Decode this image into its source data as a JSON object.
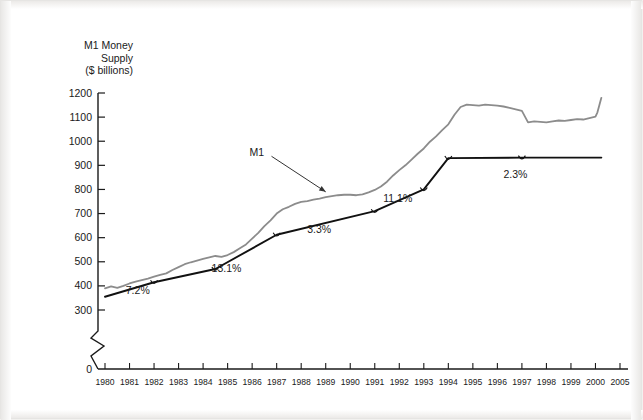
{
  "figure": {
    "title_lines": [
      "M1 Money",
      "Supply",
      "($ billions)"
    ],
    "background": "#ffffff",
    "frame_color": "#e6e5e3"
  },
  "chart_data": {
    "type": "line",
    "title": "M1 Money Supply ($ billions)",
    "xlabel": "",
    "ylabel": "M1 Money Supply ($ billions)",
    "ylim": [
      300,
      1200
    ],
    "y_axis_break_at": 0,
    "grid": false,
    "legend": "inline-annotation",
    "yticks": [
      0,
      300,
      400,
      500,
      600,
      700,
      800,
      900,
      1000,
      1100,
      1200
    ],
    "xticks": [
      "1980",
      "1981",
      "1982",
      "1983",
      "1984",
      "1985",
      "1986",
      "1987",
      "1988",
      "1989",
      "1990",
      "1991",
      "1992",
      "1993",
      "1994",
      "1995",
      "1996",
      "1997",
      "1998",
      "1999",
      "2000",
      "2005"
    ],
    "series": [
      {
        "name": "M1",
        "color": "#8c8c8c",
        "style": "actual monthly money supply",
        "x": [
          1980.0,
          1980.25,
          1980.5,
          1980.75,
          1981.0,
          1981.25,
          1981.5,
          1981.75,
          1982.0,
          1982.25,
          1982.5,
          1982.75,
          1983.0,
          1983.25,
          1983.5,
          1983.75,
          1984.0,
          1984.25,
          1984.5,
          1984.75,
          1985.0,
          1985.25,
          1985.5,
          1985.75,
          1986.0,
          1986.25,
          1986.5,
          1986.75,
          1987.0,
          1987.25,
          1987.5,
          1987.75,
          1988.0,
          1988.25,
          1988.5,
          1988.75,
          1989.0,
          1989.25,
          1989.5,
          1989.75,
          1990.0,
          1990.25,
          1990.5,
          1990.75,
          1991.0,
          1991.25,
          1991.5,
          1991.75,
          1992.0,
          1992.25,
          1992.5,
          1992.75,
          1993.0,
          1993.25,
          1993.5,
          1993.75,
          1994.0,
          1994.25,
          1994.5,
          1994.75,
          1995.0,
          1995.25,
          1995.5,
          1995.75,
          1996.0,
          1996.25,
          1996.5,
          1996.75,
          1997.0,
          1997.25,
          1997.5,
          1997.75,
          1998.0,
          1998.25,
          1998.5,
          1998.75,
          1999.0,
          1999.25,
          1999.5,
          1999.75,
          2000.0,
          2000.4,
          2000.8,
          2001.2
        ],
        "y": [
          390,
          398,
          392,
          400,
          410,
          418,
          424,
          430,
          438,
          446,
          452,
          466,
          478,
          490,
          498,
          505,
          512,
          518,
          524,
          520,
          528,
          540,
          556,
          572,
          596,
          620,
          648,
          672,
          700,
          718,
          728,
          740,
          748,
          752,
          758,
          762,
          768,
          772,
          776,
          778,
          778,
          776,
          780,
          788,
          798,
          812,
          832,
          858,
          880,
          900,
          924,
          948,
          970,
          998,
          1020,
          1046,
          1070,
          1110,
          1142,
          1152,
          1150,
          1148,
          1152,
          1150,
          1148,
          1144,
          1138,
          1132,
          1126,
          1078,
          1082,
          1080,
          1078,
          1082,
          1086,
          1084,
          1088,
          1092,
          1090,
          1096,
          1102,
          1120,
          1150,
          1180
        ]
      },
      {
        "name": "Trend (growth-rate segments)",
        "color": "#111111",
        "style": "piecewise linear trend",
        "breakpoints": [
          {
            "x": 1980.0,
            "y": 355
          },
          {
            "x": 1982.0,
            "y": 415
          },
          {
            "x": 1984.5,
            "y": 470
          },
          {
            "x": 1987.0,
            "y": 612
          },
          {
            "x": 1991.0,
            "y": 710
          },
          {
            "x": 1993.0,
            "y": 800
          },
          {
            "x": 1994.0,
            "y": 930
          },
          {
            "x": 1997.0,
            "y": 932
          },
          {
            "x": 2001.2,
            "y": 932
          }
        ]
      }
    ],
    "annotations": [
      {
        "text": "7.2%",
        "x": 1981.5,
        "y": 380,
        "label": "growth-rate-1"
      },
      {
        "text": "13.1%",
        "x": 1985.0,
        "y": 470,
        "label": "growth-rate-2"
      },
      {
        "text": "3.3%",
        "x": 1988.9,
        "y": 630,
        "label": "growth-rate-3"
      },
      {
        "text": "11.1%",
        "x": 1992.0,
        "y": 760,
        "label": "growth-rate-4"
      },
      {
        "text": "2.3%",
        "x": 1996.9,
        "y": 860,
        "label": "growth-rate-5"
      },
      {
        "text": "M1",
        "x": 1986.3,
        "y": 950,
        "label": "series-callout"
      }
    ]
  }
}
